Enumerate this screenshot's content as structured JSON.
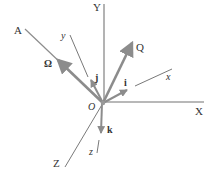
{
  "diagram": {
    "axes": {
      "X": "X",
      "Y": "Y",
      "Z": "Z",
      "x": "x",
      "y": "y",
      "z": "z",
      "A": "A"
    },
    "origin": "O",
    "vectors": {
      "omega": "Ω",
      "Q": "Q",
      "i": "i",
      "j": "j",
      "k": "k"
    },
    "colors": {
      "axis": "#a0a0a0",
      "vector": "#8c8c8c",
      "thin_line": "#555555",
      "text": "#333333"
    }
  }
}
